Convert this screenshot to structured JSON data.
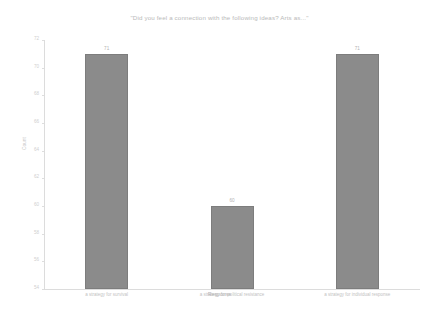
{
  "chart_data": {
    "type": "bar",
    "title": "\"Did you feel a connection with the following ideas? Arts as...\"",
    "xlabel": "Response",
    "ylabel": "Count",
    "categories": [
      "a strategy for survival",
      "a strategy for political resistance",
      "a strategy for individual response"
    ],
    "values": [
      71,
      60,
      71
    ],
    "value_labels": [
      "71",
      "60",
      "71"
    ],
    "ylim": [
      54,
      72
    ],
    "yticks": [
      54,
      56,
      58,
      60,
      62,
      64,
      66,
      68,
      70,
      72
    ],
    "ytick_labels": [
      "54",
      "56",
      "58",
      "60",
      "62",
      "64",
      "66",
      "68",
      "70",
      "72"
    ],
    "grid": false,
    "legend": false,
    "bar_color": "#8b8b8b",
    "text_color": "#bdbdbd",
    "background": "#ffffff"
  }
}
